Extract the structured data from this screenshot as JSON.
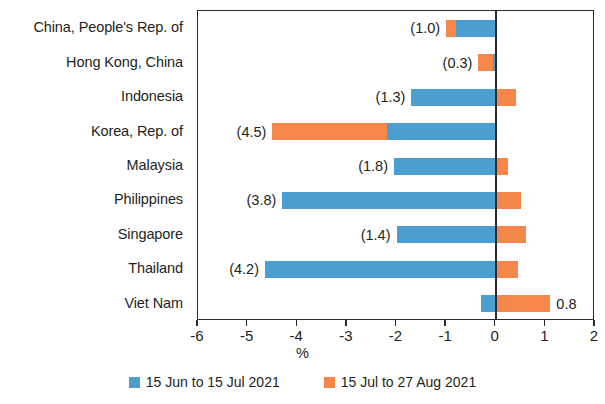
{
  "chart_data": {
    "type": "bar",
    "orientation": "horizontal",
    "stacked": true,
    "title": "",
    "xlabel": "%",
    "ylabel": "",
    "xlim": [
      -6,
      2
    ],
    "xticks": [
      -6,
      -5,
      -4,
      -3,
      -2,
      -1,
      0,
      1,
      2
    ],
    "xticklabels": [
      "-6",
      "-5",
      "-4",
      "-3",
      "-2",
      "-1",
      "0",
      "1",
      "2"
    ],
    "grid": false,
    "legend_position": "bottom",
    "categories": [
      "China, People's Rep. of",
      "Hong Kong, China",
      "Indonesia",
      "Korea, Rep. of",
      "Malaysia",
      "Philippines",
      "Singapore",
      "Thailand",
      "Viet Nam"
    ],
    "series": [
      {
        "name": "15 Jun to 15 Jul 2021",
        "color": "#4a9fd0",
        "values": [
          -0.8,
          -0.05,
          -1.7,
          -2.2,
          -2.05,
          -4.3,
          -2.0,
          -4.65,
          -0.3
        ]
      },
      {
        "name": "15 Jul to 27 Aug 2021",
        "color": "#f5874a",
        "values": [
          -0.2,
          -0.3,
          0.4,
          -2.3,
          0.25,
          0.5,
          0.6,
          0.45,
          1.1
        ]
      }
    ],
    "totals": [
      -1.0,
      -0.3,
      -1.3,
      -4.5,
      -1.8,
      -3.8,
      -1.4,
      -4.2,
      0.8
    ],
    "data_labels": [
      "(1.0)",
      "(0.3)",
      "(1.3)",
      "(4.5)",
      "(1.8)",
      "(3.8)",
      "(1.4)",
      "(4.2)",
      "0.8"
    ]
  },
  "legend": {
    "items": [
      {
        "label": "15 Jun to 15 Jul 2021",
        "color": "#4a9fd0"
      },
      {
        "label": "15 Jul to 27 Aug 2021",
        "color": "#f5874a"
      }
    ]
  },
  "axis": {
    "x_title": "%"
  }
}
